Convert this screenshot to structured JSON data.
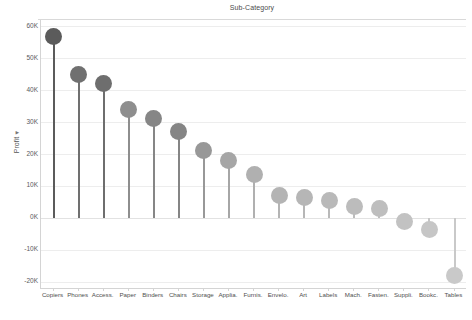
{
  "chart_data": {
    "type": "bar",
    "subtype": "lollipop",
    "title": "Sub-Category",
    "xlabel": "",
    "ylabel": "Profit",
    "ylabel_sort_indicator": "▼",
    "ylim": [
      -22000,
      62000
    ],
    "ytick_values": [
      60000,
      50000,
      40000,
      30000,
      20000,
      10000,
      0,
      -10000,
      -20000
    ],
    "ytick_labels": [
      "60K",
      "50K",
      "40K",
      "30K",
      "20K",
      "10K",
      "0K",
      "-10K",
      "-20K"
    ],
    "grid": true,
    "legend": "none",
    "categories": [
      "Copiers",
      "Phones",
      "Access.",
      "Paper",
      "Binders",
      "Chairs",
      "Storage",
      "Applia.",
      "Furnis.",
      "Envelo.",
      "Art",
      "Labels",
      "Mach.",
      "Fasten.",
      "Suppli.",
      "Bookc.",
      "Tables"
    ],
    "values": [
      57000,
      45000,
      42000,
      34000,
      31000,
      27000,
      21000,
      18000,
      13500,
      7000,
      6500,
      5500,
      3500,
      3000,
      -1000,
      -3500,
      -18000
    ],
    "colors": [
      "#5b5b5b",
      "#707070",
      "#6e6e6e",
      "#8e8e8e",
      "#868686",
      "#858585",
      "#989898",
      "#a6a6a6",
      "#b0b0b0",
      "#b4b4b4",
      "#b6b6b6",
      "#b9b9b9",
      "#bcbcbc",
      "#bebebe",
      "#c2c2c2",
      "#c6c6c6",
      "#c9c9c9"
    ],
    "accent": "#5b5b5b",
    "gridline_color": "#ededed",
    "axis_color": "#d4d4d4",
    "text_color": "#4f4f4f",
    "background": "#ffffff"
  }
}
